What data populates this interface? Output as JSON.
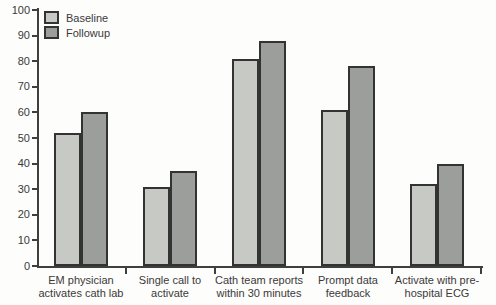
{
  "chart_data": {
    "type": "bar",
    "title": "",
    "xlabel": "",
    "ylabel": "",
    "categories": [
      "EM physician activates cath lab",
      "Single call to activate",
      "Cath team reports within 30 minutes",
      "Prompt data feedback",
      "Activate with pre-hospital ECG"
    ],
    "category_lines": [
      [
        "EM physician",
        "activates cath lab"
      ],
      [
        "Single call to",
        "activate"
      ],
      [
        "Cath team reports",
        "within 30 minutes"
      ],
      [
        "Prompt data",
        "feedback"
      ],
      [
        "Activate with pre-",
        "hospital ECG"
      ]
    ],
    "series": [
      {
        "name": "Baseline",
        "color": "#c6c9c4",
        "values": [
          52,
          31,
          81,
          61,
          32
        ]
      },
      {
        "name": "Followup",
        "color": "#9c9e9c",
        "values": [
          60,
          37,
          88,
          78,
          40
        ]
      }
    ],
    "ylim": [
      0,
      100
    ],
    "yticks": [
      0,
      10,
      20,
      30,
      40,
      50,
      60,
      70,
      80,
      90,
      100
    ],
    "grid": false,
    "legend_position": "top-left"
  },
  "colors": {
    "background": "#fdfdfc",
    "axis": "#3f3f3f",
    "bar_border": "#333331",
    "text": "#3a3a3a"
  }
}
